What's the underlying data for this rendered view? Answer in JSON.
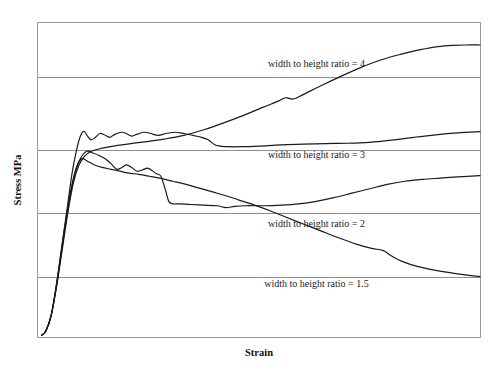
{
  "chart_data": {
    "type": "line",
    "title": "",
    "subtitle": "",
    "xlabel": "Strain",
    "ylabel": "Stress MPa",
    "grid": true,
    "grid_orientation": "horizontal",
    "gridline_count": 4,
    "legend_position": "inline-annotations",
    "xlim": [
      0,
      1
    ],
    "ylim": [
      0,
      1
    ],
    "xticks": [],
    "yticks": [],
    "xticklabels": [],
    "yticklabels": [],
    "annotations": [
      {
        "name": "label-ratio-4",
        "text": "width to height ratio = 4",
        "x": 0.63,
        "y": 0.86
      },
      {
        "name": "label-ratio-3",
        "text": "width to height ratio = 3",
        "x": 0.63,
        "y": 0.57
      },
      {
        "name": "label-ratio-2",
        "text": "width to height ratio = 2",
        "x": 0.63,
        "y": 0.35
      },
      {
        "name": "label-ratio-1.5",
        "text": "width to height ratio = 1.5",
        "x": 0.63,
        "y": 0.16
      }
    ],
    "series": [
      {
        "name": "width to height ratio = 4",
        "color": "#1a1a1a",
        "points": [
          [
            0.008,
            0.005
          ],
          [
            0.018,
            0.02
          ],
          [
            0.03,
            0.07
          ],
          [
            0.042,
            0.16
          ],
          [
            0.055,
            0.28
          ],
          [
            0.068,
            0.4
          ],
          [
            0.08,
            0.49
          ],
          [
            0.092,
            0.545
          ],
          [
            0.105,
            0.575
          ],
          [
            0.118,
            0.59
          ],
          [
            0.135,
            0.598
          ],
          [
            0.155,
            0.604
          ],
          [
            0.18,
            0.61
          ],
          [
            0.21,
            0.616
          ],
          [
            0.245,
            0.622
          ],
          [
            0.285,
            0.63
          ],
          [
            0.33,
            0.642
          ],
          [
            0.375,
            0.66
          ],
          [
            0.42,
            0.682
          ],
          [
            0.465,
            0.706
          ],
          [
            0.51,
            0.732
          ],
          [
            0.545,
            0.752
          ],
          [
            0.56,
            0.762
          ],
          [
            0.578,
            0.758
          ],
          [
            0.6,
            0.772
          ],
          [
            0.64,
            0.8
          ],
          [
            0.685,
            0.83
          ],
          [
            0.73,
            0.858
          ],
          [
            0.775,
            0.882
          ],
          [
            0.82,
            0.9
          ],
          [
            0.865,
            0.915
          ],
          [
            0.905,
            0.925
          ],
          [
            0.94,
            0.929
          ],
          [
            0.97,
            0.93
          ],
          [
            1.0,
            0.93
          ]
        ]
      },
      {
        "name": "width to height ratio = 3",
        "color": "#1a1a1a",
        "points": [
          [
            0.008,
            0.005
          ],
          [
            0.018,
            0.02
          ],
          [
            0.03,
            0.07
          ],
          [
            0.042,
            0.17
          ],
          [
            0.055,
            0.3
          ],
          [
            0.068,
            0.43
          ],
          [
            0.078,
            0.53
          ],
          [
            0.088,
            0.6
          ],
          [
            0.096,
            0.64
          ],
          [
            0.104,
            0.655
          ],
          [
            0.112,
            0.64
          ],
          [
            0.12,
            0.628
          ],
          [
            0.13,
            0.636
          ],
          [
            0.14,
            0.648
          ],
          [
            0.15,
            0.644
          ],
          [
            0.162,
            0.636
          ],
          [
            0.175,
            0.646
          ],
          [
            0.188,
            0.652
          ],
          [
            0.2,
            0.648
          ],
          [
            0.212,
            0.64
          ],
          [
            0.225,
            0.646
          ],
          [
            0.24,
            0.652
          ],
          [
            0.255,
            0.648
          ],
          [
            0.272,
            0.642
          ],
          [
            0.29,
            0.648
          ],
          [
            0.31,
            0.652
          ],
          [
            0.33,
            0.648
          ],
          [
            0.35,
            0.642
          ],
          [
            0.37,
            0.636
          ],
          [
            0.385,
            0.628
          ],
          [
            0.4,
            0.612
          ],
          [
            0.412,
            0.608
          ],
          [
            0.43,
            0.606
          ],
          [
            0.46,
            0.606
          ],
          [
            0.5,
            0.608
          ],
          [
            0.55,
            0.612
          ],
          [
            0.6,
            0.614
          ],
          [
            0.65,
            0.616
          ],
          [
            0.7,
            0.617
          ],
          [
            0.75,
            0.62
          ],
          [
            0.8,
            0.627
          ],
          [
            0.85,
            0.636
          ],
          [
            0.9,
            0.644
          ],
          [
            0.95,
            0.65
          ],
          [
            1.0,
            0.654
          ]
        ]
      },
      {
        "name": "width to height ratio = 2",
        "color": "#1a1a1a",
        "points": [
          [
            0.008,
            0.005
          ],
          [
            0.018,
            0.02
          ],
          [
            0.03,
            0.07
          ],
          [
            0.042,
            0.165
          ],
          [
            0.055,
            0.29
          ],
          [
            0.068,
            0.41
          ],
          [
            0.08,
            0.5
          ],
          [
            0.092,
            0.556
          ],
          [
            0.102,
            0.582
          ],
          [
            0.112,
            0.592
          ],
          [
            0.124,
            0.586
          ],
          [
            0.138,
            0.578
          ],
          [
            0.152,
            0.568
          ],
          [
            0.165,
            0.552
          ],
          [
            0.178,
            0.534
          ],
          [
            0.19,
            0.54
          ],
          [
            0.2,
            0.548
          ],
          [
            0.212,
            0.54
          ],
          [
            0.224,
            0.528
          ],
          [
            0.236,
            0.532
          ],
          [
            0.248,
            0.538
          ],
          [
            0.258,
            0.53
          ],
          [
            0.268,
            0.52
          ],
          [
            0.278,
            0.512
          ],
          [
            0.288,
            0.47
          ],
          [
            0.296,
            0.432
          ],
          [
            0.305,
            0.424
          ],
          [
            0.32,
            0.424
          ],
          [
            0.345,
            0.422
          ],
          [
            0.375,
            0.42
          ],
          [
            0.405,
            0.418
          ],
          [
            0.425,
            0.412
          ],
          [
            0.445,
            0.416
          ],
          [
            0.47,
            0.418
          ],
          [
            0.51,
            0.418
          ],
          [
            0.55,
            0.42
          ],
          [
            0.59,
            0.424
          ],
          [
            0.63,
            0.432
          ],
          [
            0.67,
            0.444
          ],
          [
            0.71,
            0.458
          ],
          [
            0.75,
            0.472
          ],
          [
            0.79,
            0.486
          ],
          [
            0.83,
            0.496
          ],
          [
            0.87,
            0.502
          ],
          [
            0.91,
            0.506
          ],
          [
            0.95,
            0.51
          ],
          [
            1.0,
            0.514
          ]
        ]
      },
      {
        "name": "width to height ratio = 1.5",
        "color": "#1a1a1a",
        "points": [
          [
            0.008,
            0.005
          ],
          [
            0.018,
            0.02
          ],
          [
            0.03,
            0.07
          ],
          [
            0.042,
            0.168
          ],
          [
            0.055,
            0.295
          ],
          [
            0.068,
            0.418
          ],
          [
            0.08,
            0.505
          ],
          [
            0.09,
            0.552
          ],
          [
            0.1,
            0.568
          ],
          [
            0.112,
            0.56
          ],
          [
            0.128,
            0.548
          ],
          [
            0.145,
            0.54
          ],
          [
            0.165,
            0.534
          ],
          [
            0.185,
            0.528
          ],
          [
            0.205,
            0.522
          ],
          [
            0.228,
            0.518
          ],
          [
            0.252,
            0.512
          ],
          [
            0.278,
            0.505
          ],
          [
            0.305,
            0.496
          ],
          [
            0.335,
            0.486
          ],
          [
            0.365,
            0.474
          ],
          [
            0.395,
            0.462
          ],
          [
            0.425,
            0.45
          ],
          [
            0.455,
            0.436
          ],
          [
            0.49,
            0.42
          ],
          [
            0.525,
            0.402
          ],
          [
            0.56,
            0.382
          ],
          [
            0.6,
            0.36
          ],
          [
            0.64,
            0.338
          ],
          [
            0.68,
            0.316
          ],
          [
            0.72,
            0.296
          ],
          [
            0.755,
            0.282
          ],
          [
            0.78,
            0.276
          ],
          [
            0.8,
            0.258
          ],
          [
            0.825,
            0.24
          ],
          [
            0.86,
            0.224
          ],
          [
            0.9,
            0.212
          ],
          [
            0.945,
            0.202
          ],
          [
            1.0,
            0.192
          ]
        ]
      }
    ]
  },
  "plot": {
    "frame_color": "#9a9a9a",
    "grid_color": "#8d8d8d",
    "curve_color": "#1a1a1a",
    "background": "#ffffff"
  },
  "axes": {
    "x_title": "Strain",
    "y_title": "Stress MPa"
  }
}
